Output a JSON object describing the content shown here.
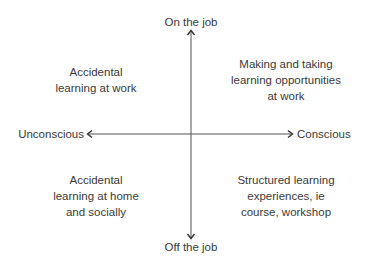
{
  "diagram": {
    "axes": {
      "vertical": {
        "top_label": "On the job",
        "bottom_label": "Off the job"
      },
      "horizontal": {
        "left_label": "Unconscious",
        "right_label": "Conscious"
      }
    },
    "quadrants": {
      "top_left": {
        "lines": [
          "Accidental",
          "learning at work"
        ]
      },
      "top_right": {
        "lines": [
          "Making and taking",
          "learning opportunities",
          "at work"
        ]
      },
      "bottom_left": {
        "lines": [
          "Accidental",
          "learning at home",
          "and socially"
        ]
      },
      "bottom_right": {
        "lines": [
          "Structured learning",
          "experiences, ie",
          "course, workshop"
        ]
      }
    },
    "colors": {
      "text": "#3a3a3a",
      "axis_line": "#555555",
      "background": "#ffffff"
    }
  }
}
